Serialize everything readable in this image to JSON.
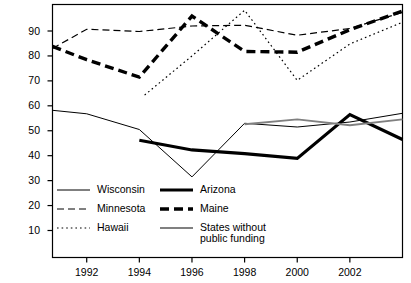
{
  "chart_data": {
    "type": "line",
    "title": "",
    "subtitle": "",
    "xlabel": "",
    "ylabel": "",
    "xlim": [
      1990.7,
      2004.0
    ],
    "ylim": [
      0,
      100
    ],
    "yticks": [
      10,
      20,
      30,
      40,
      50,
      60,
      70,
      80,
      90
    ],
    "ytick_labels": [
      "10",
      "20",
      "30",
      "40",
      "50",
      "60",
      "70",
      "80",
      "90"
    ],
    "xticks": [
      1992,
      1994,
      1996,
      1998,
      2000,
      2002
    ],
    "xtick_labels": [
      "1992",
      "1994",
      "1996",
      "1998",
      "2000",
      "2002"
    ],
    "grid": false,
    "legend_position": "inside-lower-left",
    "series": [
      {
        "name": "Wisconsin",
        "style": "thin-solid",
        "color": "#000000",
        "width": 1,
        "x": [
          1990.7,
          1992,
          1994,
          1996,
          1998,
          2000,
          2002,
          2004
        ],
        "values": [
          58.2,
          56.8,
          50.5,
          31.5,
          53.0,
          51.5,
          53.5,
          57.0
        ]
      },
      {
        "name": "Minnesota",
        "style": "dashed",
        "color": "#000000",
        "width": 1.2,
        "x": [
          1990.7,
          1992,
          1994,
          1996,
          1998,
          2000,
          2002,
          2004
        ],
        "values": [
          83.0,
          90.7,
          89.8,
          92.0,
          92.3,
          88.3,
          91.0,
          97.5
        ]
      },
      {
        "name": "Hawaii",
        "style": "dotted",
        "color": "#000000",
        "width": 1.2,
        "x": [
          1994.2,
          1996,
          1998,
          2000,
          2002,
          2004
        ],
        "values": [
          64.3,
          80.0,
          98.3,
          70.2,
          84.8,
          93.5
        ]
      },
      {
        "name": "Arizona",
        "style": "thick-solid",
        "color": "#000000",
        "width": 3.2,
        "x": [
          1994,
          1996,
          1998,
          2000,
          2002,
          2004
        ],
        "values": [
          46.2,
          42.3,
          40.8,
          38.9,
          56.5,
          46.5
        ]
      },
      {
        "name": "Maine",
        "style": "thick-dashed",
        "color": "#000000",
        "width": 3.4,
        "x": [
          1990.7,
          1992,
          1994,
          1996,
          1998,
          2000,
          2002,
          2004
        ],
        "values": [
          83.8,
          78.5,
          71.5,
          96.0,
          81.8,
          81.5,
          90.5,
          98.0
        ]
      },
      {
        "name": "States without public funding",
        "style": "gray-solid",
        "color": "#808080",
        "width": 1.8,
        "x": [
          1998,
          2000,
          2002,
          2004
        ],
        "values": [
          52.6,
          54.6,
          52.2,
          54.6
        ]
      }
    ],
    "legend": [
      {
        "label": "Wisconsin",
        "style": "thin-solid",
        "color": "#000000"
      },
      {
        "label": "Minnesota",
        "style": "dashed",
        "color": "#000000"
      },
      {
        "label": "Hawaii",
        "style": "dotted",
        "color": "#000000"
      },
      {
        "label": "Arizona",
        "style": "thick-solid",
        "color": "#000000"
      },
      {
        "label": "Maine",
        "style": "thick-dashed",
        "color": "#000000"
      },
      {
        "label": "States without",
        "label2": "public funding",
        "style": "gray-solid",
        "color": "#808080"
      }
    ],
    "axis_color": "#000000",
    "background": "#ffffff"
  }
}
